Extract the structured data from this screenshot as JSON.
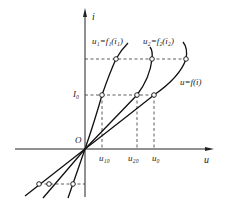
{
  "diagram": {
    "type": "characteristic-curves",
    "axes": {
      "x_label": "u",
      "y_label": "i",
      "origin_label": "O"
    },
    "curves": [
      {
        "name": "curve-1",
        "label": "u₁=f₁(i₁)"
      },
      {
        "name": "curve-2",
        "label": "u₂=f₂(i₂)"
      },
      {
        "name": "curve-combined",
        "label": "u=f(i)"
      }
    ],
    "markers": {
      "i0": "I₀",
      "u10": "u₁₀",
      "u20": "u₂₀",
      "u0": "u₀"
    },
    "colors": {
      "line": "#222222",
      "background": "#ffffff"
    }
  }
}
